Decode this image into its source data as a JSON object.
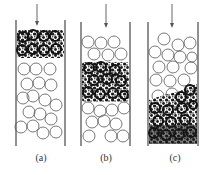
{
  "figure": {
    "colors": {
      "wall": "#555555",
      "particle_outline": "#555555",
      "dirty_band": "#1a1a1a",
      "background": "#ffffff"
    },
    "panels": [
      {
        "id": "a",
        "label": "(a)",
        "band_position": "top"
      },
      {
        "id": "b",
        "label": "(b)",
        "band_position": "middle"
      },
      {
        "id": "c",
        "label": "(c)",
        "band_position": "bottom"
      }
    ],
    "arrow_icon": "down-arrow-icon"
  }
}
